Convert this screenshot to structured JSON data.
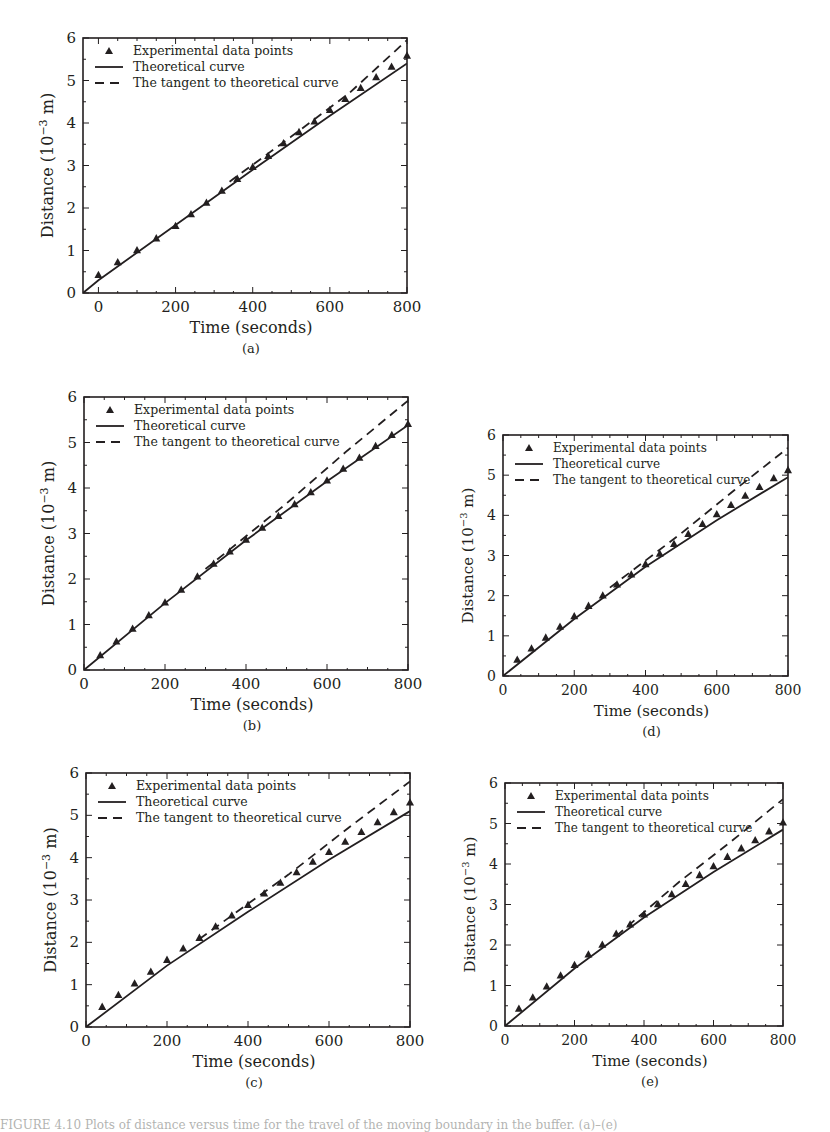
{
  "figure": {
    "legend": {
      "experimental": "Experimental data points",
      "theoretical": "Theoretical curve",
      "tangent": "The tangent to theoretical curve"
    },
    "xlabel": "Time (seconds)",
    "ylabel_main": "Distance (10",
    "ylabel_exp": "−3",
    "ylabel_tail": " m)",
    "colors": {
      "ink": "#231f20",
      "background": "#ffffff"
    }
  },
  "chart_data": [
    {
      "id": "a",
      "label": "(a)",
      "type": "line",
      "title": "",
      "xlabel": "Time (seconds)",
      "ylabel": "Distance (10^-3 m)",
      "xlim": [
        -40,
        800
      ],
      "ylim": [
        0,
        6
      ],
      "xticks": [
        0,
        200,
        400,
        600,
        800
      ],
      "yticks": [
        0,
        1,
        2,
        3,
        4,
        5,
        6
      ],
      "grid": false,
      "legend_position": "upper left",
      "frame": {
        "left": 83,
        "top": 38,
        "right": 407,
        "bottom": 293
      },
      "series": [
        {
          "name": "Experimental data points",
          "style": "markers-triangle",
          "x": [
            0,
            50,
            100,
            150,
            200,
            240,
            280,
            320,
            360,
            400,
            440,
            480,
            520,
            560,
            600,
            640,
            680,
            720,
            760,
            800
          ],
          "y": [
            0.42,
            0.72,
            1.0,
            1.28,
            1.57,
            1.85,
            2.12,
            2.4,
            2.68,
            2.96,
            3.22,
            3.52,
            3.78,
            4.03,
            4.3,
            4.56,
            4.82,
            5.07,
            5.32,
            5.58
          ]
        },
        {
          "name": "Theoretical curve",
          "style": "solid",
          "x": [
            -40,
            0,
            200,
            400,
            600,
            800
          ],
          "y": [
            0.0,
            0.3,
            1.6,
            2.9,
            4.17,
            5.4
          ]
        },
        {
          "name": "The tangent to theoretical curve",
          "style": "dashed",
          "x": [
            340,
            500,
            650,
            800
          ],
          "y": [
            2.62,
            3.68,
            4.7,
            5.95
          ]
        }
      ]
    },
    {
      "id": "b",
      "label": "(b)",
      "type": "line",
      "title": "",
      "xlabel": "Time (seconds)",
      "ylabel": "Distance (10^-3 m)",
      "xlim": [
        0,
        800
      ],
      "ylim": [
        0,
        6
      ],
      "xticks": [
        0,
        200,
        400,
        600,
        800
      ],
      "yticks": [
        0,
        1,
        2,
        3,
        4,
        5,
        6
      ],
      "grid": false,
      "legend_position": "upper left",
      "frame": {
        "left": 84,
        "top": 397,
        "right": 408,
        "bottom": 670
      },
      "series": [
        {
          "name": "Experimental data points",
          "style": "markers-triangle",
          "x": [
            40,
            80,
            120,
            160,
            200,
            240,
            280,
            320,
            360,
            400,
            440,
            480,
            520,
            560,
            600,
            640,
            680,
            720,
            760,
            800
          ],
          "y": [
            0.32,
            0.62,
            0.9,
            1.2,
            1.48,
            1.76,
            2.05,
            2.33,
            2.6,
            2.86,
            3.12,
            3.38,
            3.64,
            3.9,
            4.16,
            4.42,
            4.66,
            4.92,
            5.16,
            5.4
          ]
        },
        {
          "name": "Theoretical curve",
          "style": "solid",
          "x": [
            0,
            200,
            400,
            600,
            800
          ],
          "y": [
            0.0,
            1.47,
            2.85,
            4.15,
            5.38
          ]
        },
        {
          "name": "The tangent to theoretical curve",
          "style": "dashed",
          "x": [
            300,
            500,
            650,
            800
          ],
          "y": [
            2.22,
            3.66,
            4.82,
            5.92
          ]
        }
      ]
    },
    {
      "id": "d",
      "label": "(d)",
      "type": "line",
      "title": "",
      "xlabel": "Time (seconds)",
      "ylabel": "Distance (10^-3 m)",
      "xlim": [
        0,
        800
      ],
      "ylim": [
        0,
        6
      ],
      "xticks": [
        0,
        200,
        400,
        600,
        800
      ],
      "yticks": [
        0,
        1,
        2,
        3,
        4,
        5,
        6
      ],
      "grid": false,
      "legend_position": "upper left",
      "frame": {
        "left": 503,
        "top": 435,
        "right": 788,
        "bottom": 676
      },
      "series": [
        {
          "name": "Experimental data points",
          "style": "markers-triangle",
          "x": [
            40,
            80,
            120,
            160,
            200,
            240,
            280,
            320,
            360,
            400,
            440,
            480,
            520,
            560,
            600,
            640,
            680,
            720,
            760,
            800
          ],
          "y": [
            0.4,
            0.68,
            0.95,
            1.22,
            1.48,
            1.74,
            2.0,
            2.27,
            2.52,
            2.78,
            3.04,
            3.28,
            3.53,
            3.78,
            4.02,
            4.25,
            4.48,
            4.7,
            4.92,
            5.12
          ]
        },
        {
          "name": "Theoretical curve",
          "style": "solid",
          "x": [
            0,
            200,
            400,
            600,
            800
          ],
          "y": [
            0.0,
            1.42,
            2.72,
            3.88,
            4.95
          ]
        },
        {
          "name": "The tangent to theoretical curve",
          "style": "dashed",
          "x": [
            300,
            500,
            650,
            800
          ],
          "y": [
            2.2,
            3.55,
            4.63,
            5.68
          ]
        }
      ]
    },
    {
      "id": "c",
      "label": "(c)",
      "type": "line",
      "title": "",
      "xlabel": "Time (seconds)",
      "ylabel": "Distance (10^-3 m)",
      "xlim": [
        0,
        800
      ],
      "ylim": [
        0,
        6
      ],
      "xticks": [
        0,
        200,
        400,
        600,
        800
      ],
      "yticks": [
        0,
        1,
        2,
        3,
        4,
        5,
        6
      ],
      "grid": false,
      "legend_position": "upper left",
      "frame": {
        "left": 86,
        "top": 773,
        "right": 410,
        "bottom": 1027
      },
      "series": [
        {
          "name": "Experimental data points",
          "style": "markers-triangle",
          "x": [
            40,
            80,
            120,
            160,
            200,
            240,
            280,
            320,
            360,
            400,
            440,
            480,
            520,
            560,
            600,
            640,
            680,
            720,
            760,
            800
          ],
          "y": [
            0.47,
            0.75,
            1.02,
            1.3,
            1.58,
            1.85,
            2.1,
            2.37,
            2.63,
            2.88,
            3.15,
            3.4,
            3.65,
            3.9,
            4.13,
            4.37,
            4.6,
            4.83,
            5.07,
            5.3
          ]
        },
        {
          "name": "Theoretical curve",
          "style": "solid",
          "x": [
            0,
            200,
            400,
            600,
            800
          ],
          "y": [
            0.0,
            1.45,
            2.72,
            3.95,
            5.1
          ]
        },
        {
          "name": "The tangent to theoretical curve",
          "style": "dashed",
          "x": [
            280,
            500,
            650,
            800
          ],
          "y": [
            2.08,
            3.6,
            4.72,
            5.8
          ]
        }
      ]
    },
    {
      "id": "e",
      "label": "(e)",
      "type": "line",
      "title": "",
      "xlabel": "Time (seconds)",
      "ylabel": "Distance (10^-3 m)",
      "xlim": [
        0,
        800
      ],
      "ylim": [
        0,
        6
      ],
      "xticks": [
        0,
        200,
        400,
        600,
        800
      ],
      "yticks": [
        0,
        1,
        2,
        3,
        4,
        5,
        6
      ],
      "grid": false,
      "legend_position": "upper left",
      "frame": {
        "left": 505,
        "top": 783,
        "right": 783,
        "bottom": 1026
      },
      "series": [
        {
          "name": "Experimental data points",
          "style": "markers-triangle",
          "x": [
            40,
            80,
            120,
            160,
            200,
            240,
            280,
            320,
            360,
            400,
            440,
            480,
            520,
            560,
            600,
            640,
            680,
            720,
            760,
            800
          ],
          "y": [
            0.42,
            0.7,
            0.97,
            1.24,
            1.5,
            1.76,
            2.0,
            2.27,
            2.5,
            2.75,
            3.0,
            3.25,
            3.5,
            3.72,
            3.94,
            4.17,
            4.38,
            4.58,
            4.8,
            5.02
          ]
        },
        {
          "name": "Theoretical curve",
          "style": "solid",
          "x": [
            0,
            200,
            400,
            600,
            800
          ],
          "y": [
            0.0,
            1.42,
            2.68,
            3.8,
            4.85
          ]
        },
        {
          "name": "The tangent to theoretical curve",
          "style": "dashed",
          "x": [
            320,
            500,
            650,
            800
          ],
          "y": [
            2.22,
            3.55,
            4.55,
            5.6
          ]
        }
      ]
    }
  ],
  "caption_fragment": "FIGURE 4.10   Plots of distance versus time for the travel of the moving boundary in the buffer. (a)–(e)"
}
